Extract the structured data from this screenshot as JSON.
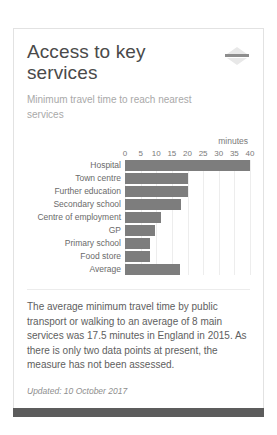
{
  "card": {
    "title": "Access to key services",
    "subtitle": "Minimum travel time to reach nearest services",
    "collapse_icon": "collapse-minus-icon",
    "body_text": "The average minimum travel time by public transport or walking to an average of 8 main services was 17.5 minutes in England in 2015. As there is only two data points at present, the measure has not been assessed.",
    "updated": "Updated: 10 October 2017",
    "accent_color": "#7d7d7d",
    "border_color": "#e2e2e2",
    "footer_color": "#5c5c5c"
  },
  "chart_data": {
    "type": "bar",
    "orientation": "horizontal",
    "title": "Access to key services",
    "subtitle": "Minimum travel time to reach nearest services",
    "xlabel": "minutes",
    "ylabel": "",
    "unit_label": "minutes",
    "categories": [
      "Hospital",
      "Town centre",
      "Further education",
      "Secondary school",
      "Centre of employment",
      "GP",
      "Primary school",
      "Food store",
      "Average"
    ],
    "values": [
      40,
      20,
      20,
      18,
      11.5,
      9.5,
      8,
      8,
      17.5
    ],
    "xlim": [
      0,
      40
    ],
    "ticks": [
      0,
      5,
      10,
      15,
      20,
      25,
      30,
      35,
      40
    ],
    "tick_labels": [
      "0",
      "5",
      "10",
      "15",
      "20",
      "25",
      "30",
      "35",
      "40"
    ],
    "grid": true,
    "legend": false,
    "bar_color": "#7d7d7d"
  }
}
